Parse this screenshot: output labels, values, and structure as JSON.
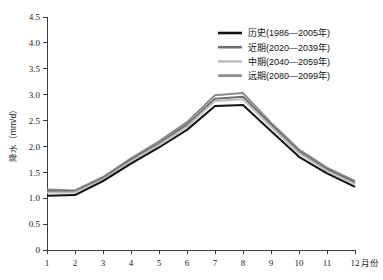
{
  "chart_data": {
    "type": "line",
    "title": "",
    "xlabel": "月份",
    "ylabel": "降水（mm/d）",
    "categories": [
      "1",
      "2",
      "3",
      "4",
      "5",
      "6",
      "7",
      "8",
      "9",
      "10",
      "11",
      "12"
    ],
    "x": [
      1,
      2,
      3,
      4,
      5,
      6,
      7,
      8,
      9,
      10,
      11,
      12
    ],
    "xlim": [
      1,
      12
    ],
    "ylim": [
      0,
      4.5
    ],
    "yticks": [
      "0",
      "0.5",
      "1.0",
      "1.5",
      "2.0",
      "2.5",
      "3.0",
      "3.5",
      "4.0",
      "4.5"
    ],
    "ytick_values": [
      0,
      0.5,
      1.0,
      1.5,
      2.0,
      2.5,
      3.0,
      3.5,
      4.0,
      4.5
    ],
    "grid": false,
    "legend_position": "top-right",
    "series": [
      {
        "name": "历史(1986—2005年)",
        "color": "#111111",
        "values": [
          1.05,
          1.06,
          1.33,
          1.67,
          1.98,
          2.32,
          2.78,
          2.8,
          2.3,
          1.8,
          1.48,
          1.22
        ]
      },
      {
        "name": "近期(2020—2039年)",
        "color": "#6e6e6e",
        "values": [
          1.14,
          1.13,
          1.38,
          1.74,
          2.06,
          2.42,
          2.92,
          2.96,
          2.42,
          1.9,
          1.56,
          1.3
        ]
      },
      {
        "name": "中期(2040—2059年)",
        "color": "#bdbdbd",
        "values": [
          1.11,
          1.11,
          1.36,
          1.71,
          2.03,
          2.38,
          2.88,
          2.91,
          2.38,
          1.87,
          1.53,
          1.27
        ]
      },
      {
        "name": "远期(2080—2099年)",
        "color": "#8a8a8a",
        "values": [
          1.17,
          1.15,
          1.41,
          1.77,
          2.1,
          2.47,
          2.99,
          3.03,
          2.46,
          1.94,
          1.59,
          1.33
        ]
      }
    ]
  }
}
